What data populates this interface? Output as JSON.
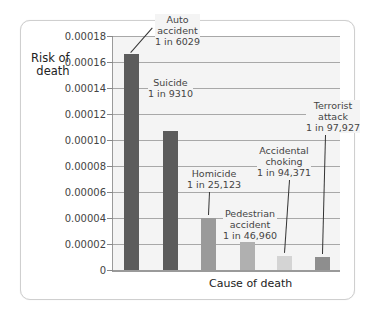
{
  "chart_data": {
    "type": "bar",
    "title": "",
    "xlabel": "Cause of death",
    "ylabel": "Risk of death",
    "ylim": [
      0,
      0.00018
    ],
    "yticks": [
      "0",
      "0.00002",
      "0.00004",
      "0.00006",
      "0.00008",
      "0.00010",
      "0.00012",
      "0.00014",
      "0.00016",
      "0.00018"
    ],
    "grid": true,
    "legend": "none",
    "categories": [
      "Auto accident",
      "Suicide",
      "Homicide",
      "Pedestrian accident",
      "Accidental choking",
      "Terrorist attack"
    ],
    "values": [
      0.000166,
      0.000107,
      3.98e-05,
      2.13e-05,
      1.06e-05,
      1.02e-05
    ],
    "annotations": [
      {
        "category": "Auto accident",
        "lines": [
          "Auto",
          "accident",
          "1 in 6029"
        ]
      },
      {
        "category": "Suicide",
        "lines": [
          "Suicide",
          "1 in 9310"
        ]
      },
      {
        "category": "Homicide",
        "lines": [
          "Homicide",
          "1 in 25,123"
        ]
      },
      {
        "category": "Pedestrian accident",
        "lines": [
          "Pedestrian",
          "accident",
          "1 in 46,960"
        ]
      },
      {
        "category": "Accidental choking",
        "lines": [
          "Accidental",
          "choking",
          "1 in 94,371"
        ]
      },
      {
        "category": "Terrorist attack",
        "lines": [
          "Terrorist",
          "attack",
          "1 in 97,927"
        ]
      }
    ],
    "bar_colors": [
      "#5c5c5c",
      "#5c5c5c",
      "#9a9a9a",
      "#b0b0b0",
      "#d4d4d4",
      "#8e8e8e"
    ]
  },
  "labels": {
    "ylabel_line1": "Risk of",
    "ylabel_line2": "death",
    "xlabel": "Cause of death"
  }
}
